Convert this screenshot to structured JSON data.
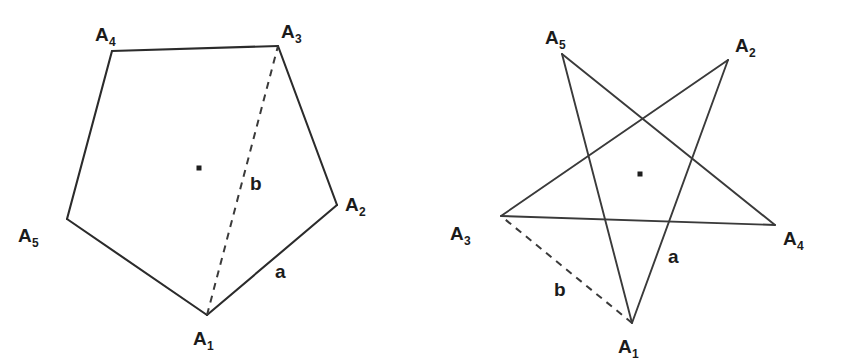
{
  "figure": {
    "background_color": "#ffffff",
    "line_color": "#2b2b2b",
    "dash_color": "#3a3a3a",
    "label_color": "#1b1b1b",
    "width": 841,
    "height": 361
  },
  "chart_data": {
    "type": "diagram",
    "panels": [
      {
        "name": "pentagon",
        "shape": "convex-pentagon",
        "vertex_order": [
          "A1",
          "A2",
          "A3",
          "A4",
          "A5"
        ],
        "vertices": [
          {
            "label": "A",
            "sub": "1",
            "x": 207,
            "y": 315,
            "label_x": 193,
            "label_y": 345
          },
          {
            "label": "A",
            "sub": "2",
            "x": 337,
            "y": 205,
            "label_x": 345,
            "label_y": 211
          },
          {
            "label": "A",
            "sub": "3",
            "x": 278,
            "y": 46,
            "label_x": 281,
            "label_y": 38
          },
          {
            "label": "A",
            "sub": "4",
            "x": 112,
            "y": 51,
            "label_x": 95,
            "label_y": 41
          },
          {
            "label": "A",
            "sub": "5",
            "x": 67,
            "y": 219,
            "label_x": 18,
            "label_y": 242
          }
        ],
        "center_dot": {
          "x": 199,
          "y": 168,
          "size": 5
        },
        "solid_edges": [
          [
            "A1",
            "A2"
          ],
          [
            "A2",
            "A3"
          ],
          [
            "A3",
            "A4"
          ],
          [
            "A4",
            "A5"
          ],
          [
            "A5",
            "A1"
          ]
        ],
        "dashed_segments": [
          [
            "A1",
            "A3"
          ]
        ],
        "measure_labels": [
          {
            "text": "a",
            "x": 275,
            "y": 278,
            "describes": "side A1A2"
          },
          {
            "text": "b",
            "x": 250,
            "y": 190,
            "describes": "diagonal A1A3"
          }
        ]
      },
      {
        "name": "pentagram",
        "shape": "star-polygon",
        "vertex_order": [
          "A1",
          "A2",
          "A3",
          "A4",
          "A5"
        ],
        "vertices": [
          {
            "label": "A",
            "sub": "1",
            "x": 632,
            "y": 323,
            "label_x": 618,
            "label_y": 353
          },
          {
            "label": "A",
            "sub": "2",
            "x": 728,
            "y": 60,
            "label_x": 735,
            "label_y": 52
          },
          {
            "label": "A",
            "sub": "3",
            "x": 501,
            "y": 216,
            "label_x": 450,
            "label_y": 240
          },
          {
            "label": "A",
            "sub": "4",
            "x": 775,
            "y": 225,
            "label_x": 783,
            "label_y": 245
          },
          {
            "label": "A",
            "sub": "5",
            "x": 562,
            "y": 54,
            "label_x": 545,
            "label_y": 44
          }
        ],
        "center_dot": {
          "x": 640,
          "y": 174,
          "size": 5
        },
        "solid_edges": [
          [
            "A1",
            "A2"
          ],
          [
            "A2",
            "A3"
          ],
          [
            "A3",
            "A4"
          ],
          [
            "A4",
            "A5"
          ],
          [
            "A5",
            "A1"
          ]
        ],
        "dashed_segments": [
          [
            "A1",
            "A3"
          ]
        ],
        "measure_labels": [
          {
            "text": "a",
            "x": 668,
            "y": 263,
            "describes": "star side A1A2"
          },
          {
            "text": "b",
            "x": 554,
            "y": 296,
            "describes": "segment A1A3"
          }
        ]
      }
    ]
  }
}
